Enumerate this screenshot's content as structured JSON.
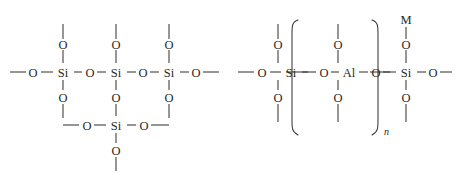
{
  "figure": {
    "background_color": "#ffffff",
    "line_color": "#3a3732",
    "text_color": "#2a2724",
    "width": 457,
    "height": 182
  },
  "structures": [
    {
      "id": "silicate-network",
      "name": "Silica (SiO2) framework fragment",
      "atoms": {
        "silicon": [
          "Si",
          "Si",
          "Si",
          "Si"
        ],
        "oxygen": [
          "O",
          "O",
          "O",
          "O",
          "O",
          "O",
          "O",
          "O",
          "O",
          "O"
        ]
      },
      "labels": {
        "si_1": "Si",
        "si_2": "Si",
        "si_3": "Si",
        "si_4": "Si",
        "o_top_1": "O",
        "o_top_2": "O",
        "o_top_3": "O",
        "o_left_end": "O",
        "o_bridge_12": "O",
        "o_bridge_23": "O",
        "o_right_end": "O",
        "o_bottom_1": "O",
        "o_bottom_2": "O",
        "o_bottom_3": "O",
        "o_row2_left": "O",
        "o_row2_right": "O",
        "o_row2_bottom": "O"
      }
    },
    {
      "id": "aluminosilicate-network",
      "name": "Aluminosilicate framework fragment with repeat unit n and counter-cation M",
      "labels": {
        "si_left": "Si",
        "al_center": "Al",
        "si_right": "Si",
        "o_left_end": "O",
        "o_top_si_left": "O",
        "o_bottom_si_left": "O",
        "o_bridge_left": "O",
        "o_top_al": "O",
        "o_bottom_al": "O",
        "o_bridge_right": "O",
        "o_top_si_right": "O",
        "o_bottom_si_right": "O",
        "o_right_end": "O",
        "cation": "M",
        "repeat_subscript": "n"
      },
      "brackets": {
        "left": "(",
        "right": ")",
        "subscript": "n"
      }
    }
  ]
}
